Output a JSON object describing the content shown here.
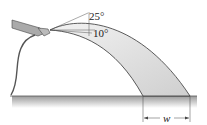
{
  "diagram": {
    "angles": {
      "upper": "25°",
      "lower": "10°"
    },
    "dimension": {
      "label": "w"
    },
    "colors": {
      "stream": "#d8d8d8",
      "outline": "#333333",
      "ground": "#999999"
    }
  }
}
